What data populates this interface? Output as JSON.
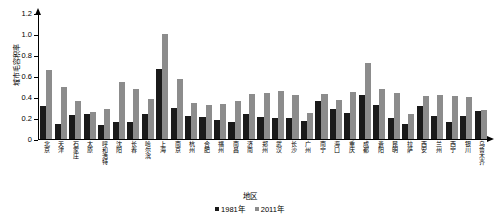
{
  "chart_data": {
    "type": "bar",
    "title": "",
    "xlabel": "地区",
    "ylabel": "城市毛容积率",
    "ylim": [
      0,
      1.2
    ],
    "yticks": [
      "0",
      "0.2",
      "0.4",
      "0.6",
      "0.8",
      "1.0",
      "1.2"
    ],
    "ytick_values": [
      0,
      0.2,
      0.4,
      0.6,
      0.8,
      1.0,
      1.2
    ],
    "grid": false,
    "legend_position": "bottom-center",
    "categories": [
      "北京",
      "天津",
      "石家庄",
      "太原",
      "呼和浩特",
      "沈阳",
      "长春",
      "哈尔滨",
      "上海",
      "南京",
      "杭州",
      "合肥",
      "福州",
      "南昌",
      "济南",
      "郑州",
      "武汉",
      "长沙",
      "广州",
      "南宁",
      "海口",
      "重庆",
      "成都",
      "贵阳",
      "昆明",
      "拉萨",
      "西安",
      "兰州",
      "西宁",
      "银川",
      "乌鲁木齐"
    ],
    "series": [
      {
        "name": "1981年",
        "color": "#1a1a1a",
        "values": [
          0.31,
          0.14,
          0.23,
          0.24,
          0.13,
          0.16,
          0.16,
          0.24,
          0.67,
          0.3,
          0.22,
          0.21,
          0.18,
          0.16,
          0.24,
          0.21,
          0.2,
          0.2,
          0.17,
          0.36,
          0.29,
          0.25,
          0.42,
          0.32,
          0.2,
          0.14,
          0.31,
          0.22,
          0.16,
          0.22,
          0.27
        ]
      },
      {
        "name": "2011年",
        "color": "#8c8c8c",
        "values": [
          0.66,
          0.5,
          0.36,
          0.26,
          0.29,
          0.54,
          0.48,
          0.38,
          1.0,
          0.57,
          0.34,
          0.32,
          0.33,
          0.36,
          0.43,
          0.44,
          0.46,
          0.42,
          0.25,
          0.43,
          0.37,
          0.45,
          0.72,
          0.48,
          0.44,
          0.24,
          0.41,
          0.42,
          0.41,
          0.4,
          0.28
        ]
      }
    ]
  },
  "legend": {
    "items": [
      {
        "label": "1981年"
      },
      {
        "label": "2011年"
      }
    ]
  }
}
